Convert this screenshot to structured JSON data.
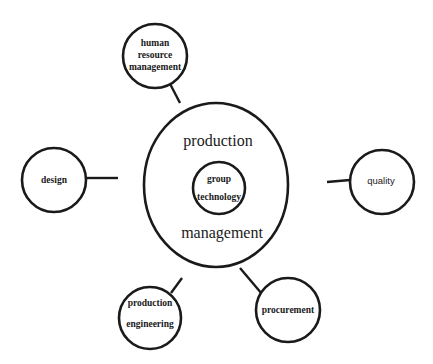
{
  "diagram": {
    "center": {
      "outer_label_top": "production",
      "outer_label_bottom": "management",
      "inner_label_line1": "group",
      "inner_label_line2": "technology"
    },
    "nodes": {
      "hrm": {
        "line1": "human",
        "line2": "resource",
        "line3": "management"
      },
      "design": {
        "label": "design"
      },
      "quality": {
        "label": "quality"
      },
      "production_engineering": {
        "line1": "production",
        "line2": "engineering"
      },
      "procurement": {
        "label": "procurement"
      }
    },
    "colors": {
      "stroke": "#1a1a1a",
      "background": "#ffffff"
    }
  }
}
